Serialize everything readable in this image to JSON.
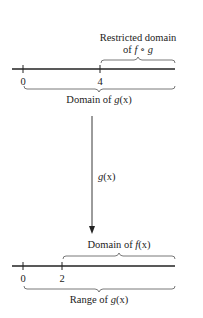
{
  "top_line": {
    "ticks": [
      {
        "label": "0",
        "x": 23
      },
      {
        "label": "4",
        "x": 100
      }
    ],
    "upper_brace_label_line1": "Restricted domain",
    "upper_brace_label_line2_prefix": "of ",
    "upper_brace_label_line2_math": "f ∘ g",
    "lower_brace_label_prefix": "Domain of ",
    "lower_brace_label_math": "g",
    "lower_brace_label_suffix": "(x)"
  },
  "mapping_arrow": {
    "label_math": "g",
    "label_suffix": "(x)"
  },
  "bottom_line": {
    "ticks": [
      {
        "label": "0",
        "x": 23
      },
      {
        "label": "2",
        "x": 62
      }
    ],
    "upper_brace_label_prefix": "Domain of ",
    "upper_brace_label_math": "f",
    "upper_brace_label_suffix": "(x)",
    "lower_brace_label_prefix": "Range of ",
    "lower_brace_label_math": "g",
    "lower_brace_label_suffix": "(x)"
  },
  "colors": {
    "line": "#222222",
    "brace": "#555555",
    "background": "#ffffff"
  }
}
